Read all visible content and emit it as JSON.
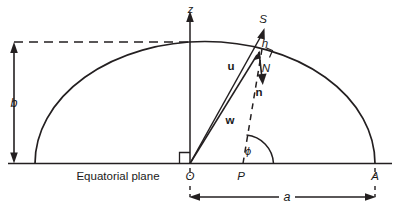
{
  "figure": {
    "title_text": "",
    "background_color": "#ffffff",
    "line_color": "#231f20",
    "text_color": "#1a1a1a"
  },
  "axes": {
    "z_axis_label": "z",
    "baseline_label": "Equatorial plane"
  },
  "points": {
    "origin": "O",
    "foot": "P",
    "apex": "A",
    "normal_foot": "N"
  },
  "vectors": {
    "s": "S",
    "u": "u",
    "w": "w",
    "n": "n"
  },
  "lengths": {
    "semi_minor": "b",
    "semi_major": "a",
    "height": "h"
  },
  "angles": {
    "phi": "ϕ"
  }
}
